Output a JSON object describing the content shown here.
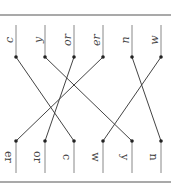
{
  "diagram": {
    "type": "permutation-matching",
    "top_labels": [
      "c",
      "y",
      "or",
      "er",
      "n",
      "w"
    ],
    "bottom_labels": [
      "er",
      "or",
      "c",
      "w",
      "y",
      "n"
    ],
    "connections": [
      {
        "from_top": "c",
        "to_bottom": "c"
      },
      {
        "from_top": "y",
        "to_bottom": "y"
      },
      {
        "from_top": "or",
        "to_bottom": "or"
      },
      {
        "from_top": "er",
        "to_bottom": "er"
      },
      {
        "from_top": "n",
        "to_bottom": "n"
      },
      {
        "from_top": "w",
        "to_bottom": "w"
      }
    ],
    "colors": {
      "line": "#444444",
      "dot": "#222222",
      "border": "#555555"
    }
  }
}
